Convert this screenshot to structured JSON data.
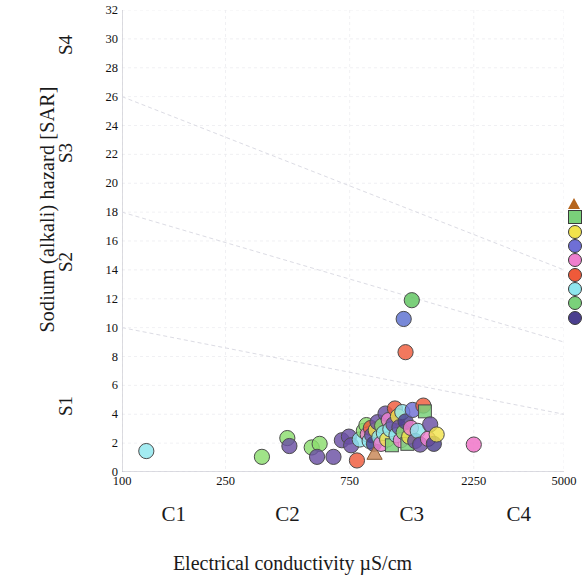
{
  "chart_data": {
    "type": "scatter",
    "title": "",
    "xlabel": "Electrical conductivity µS/cm",
    "ylabel": "Sodium (alkali) hazard [SAR]",
    "x_scale": "log",
    "xlim": [
      100,
      5000
    ],
    "ylim": [
      0,
      32
    ],
    "x_ticks": [
      "100",
      "250",
      "750",
      "2250",
      "5000"
    ],
    "x_tick_values": [
      100,
      250,
      750,
      2250,
      5000
    ],
    "y_ticks": [
      "0",
      "2",
      "4",
      "6",
      "8",
      "10",
      "12",
      "14",
      "16",
      "18",
      "20",
      "22",
      "24",
      "26",
      "28",
      "30",
      "32"
    ],
    "y_tick_values": [
      0,
      2,
      4,
      6,
      8,
      10,
      12,
      14,
      16,
      18,
      20,
      22,
      24,
      26,
      28,
      30,
      32
    ],
    "grid": true,
    "legend_position": "right",
    "salinity_classes": [
      {
        "label": "C1",
        "center_value": 158
      },
      {
        "label": "C2",
        "center_value": 433
      },
      {
        "label": "C3",
        "center_value": 1299
      },
      {
        "label": "C4",
        "center_value": 3354
      }
    ],
    "sodium_classes": [
      {
        "label": "S1",
        "center_sar": 4.5
      },
      {
        "label": "S2",
        "center_sar": 14.5
      },
      {
        "label": "S3",
        "center_sar": 22.0
      },
      {
        "label": "S4",
        "center_sar": 29.5
      }
    ],
    "boundary_lines": [
      {
        "name": "S1/S2",
        "points": [
          [
            100,
            10
          ],
          [
            5000,
            4
          ]
        ]
      },
      {
        "name": "S2/S3",
        "points": [
          [
            100,
            18
          ],
          [
            5000,
            9
          ]
        ]
      },
      {
        "name": "S3/S4",
        "points": [
          [
            100,
            26
          ],
          [
            5000,
            14
          ]
        ]
      }
    ],
    "legend_entries": [
      {
        "marker": "triangle",
        "color": "#b5651d"
      },
      {
        "marker": "square",
        "color": "#7ad17a"
      },
      {
        "marker": "circle",
        "color": "#f2e34c"
      },
      {
        "marker": "circle",
        "color": "#6f6fd6"
      },
      {
        "marker": "circle",
        "color": "#ef7fce"
      },
      {
        "marker": "circle",
        "color": "#ef5a3a"
      },
      {
        "marker": "circle",
        "color": "#8fe6ee"
      },
      {
        "marker": "circle",
        "color": "#7ad17a"
      },
      {
        "marker": "circle",
        "color": "#4b3f8f"
      }
    ],
    "points": [
      {
        "x": 124,
        "y": 1.45,
        "color": "#8fe6ee",
        "marker": "circle"
      },
      {
        "x": 345,
        "y": 1.05,
        "color": "#8bdd6e",
        "marker": "circle"
      },
      {
        "x": 432,
        "y": 2.35,
        "color": "#8bdd6e",
        "marker": "circle"
      },
      {
        "x": 440,
        "y": 1.8,
        "color": "#6a4fa3",
        "marker": "circle"
      },
      {
        "x": 536,
        "y": 1.7,
        "color": "#8bdd6e",
        "marker": "circle"
      },
      {
        "x": 575,
        "y": 1.95,
        "color": "#8bdd6e",
        "marker": "circle"
      },
      {
        "x": 562,
        "y": 1.05,
        "color": "#6a4fa3",
        "marker": "circle"
      },
      {
        "x": 650,
        "y": 1.05,
        "color": "#6a4fa3",
        "marker": "circle"
      },
      {
        "x": 700,
        "y": 2.2,
        "color": "#6a4fa3",
        "marker": "circle"
      },
      {
        "x": 745,
        "y": 2.45,
        "color": "#6a4fa3",
        "marker": "circle"
      },
      {
        "x": 760,
        "y": 1.85,
        "color": "#6a4fa3",
        "marker": "circle"
      },
      {
        "x": 800,
        "y": 0.8,
        "color": "#ef5a3a",
        "marker": "circle"
      },
      {
        "x": 820,
        "y": 2.25,
        "color": "#8fe6ee",
        "marker": "circle"
      },
      {
        "x": 850,
        "y": 2.85,
        "color": "#8bdd6e",
        "marker": "circle"
      },
      {
        "x": 870,
        "y": 3.25,
        "color": "#8bdd6e",
        "marker": "circle"
      },
      {
        "x": 880,
        "y": 2.6,
        "color": "#ef7fce",
        "marker": "circle"
      },
      {
        "x": 895,
        "y": 2.15,
        "color": "#8fe6ee",
        "marker": "circle"
      },
      {
        "x": 905,
        "y": 3.05,
        "color": "#ef5a3a",
        "marker": "circle"
      },
      {
        "x": 915,
        "y": 2.55,
        "color": "#6a4fa3",
        "marker": "circle"
      },
      {
        "x": 930,
        "y": 1.95,
        "color": "#4b3f8f",
        "marker": "circle"
      },
      {
        "x": 935,
        "y": 1.3,
        "color": "#c98a5a",
        "marker": "triangle"
      },
      {
        "x": 945,
        "y": 2.9,
        "color": "#f2e34c",
        "marker": "circle"
      },
      {
        "x": 960,
        "y": 3.45,
        "color": "#6a4fa3",
        "marker": "circle"
      },
      {
        "x": 975,
        "y": 2.4,
        "color": "#8fe6ee",
        "marker": "circle"
      },
      {
        "x": 990,
        "y": 1.95,
        "color": "#ef7fce",
        "marker": "circle"
      },
      {
        "x": 1000,
        "y": 3.2,
        "color": "#8bdd6e",
        "marker": "circle"
      },
      {
        "x": 1015,
        "y": 2.7,
        "color": "#8fe6ee",
        "marker": "circle"
      },
      {
        "x": 1030,
        "y": 4.05,
        "color": "#6a4fa3",
        "marker": "circle"
      },
      {
        "x": 1045,
        "y": 2.25,
        "color": "#f2e34c",
        "marker": "circle"
      },
      {
        "x": 1060,
        "y": 3.6,
        "color": "#ef7fce",
        "marker": "circle"
      },
      {
        "x": 1075,
        "y": 2.95,
        "color": "#8fe6ee",
        "marker": "circle"
      },
      {
        "x": 1090,
        "y": 1.85,
        "color": "#7ad17a",
        "marker": "square"
      },
      {
        "x": 1105,
        "y": 3.3,
        "color": "#6a4fa3",
        "marker": "circle"
      },
      {
        "x": 1120,
        "y": 4.4,
        "color": "#ef5a3a",
        "marker": "circle"
      },
      {
        "x": 1135,
        "y": 2.55,
        "color": "#8fe6ee",
        "marker": "circle"
      },
      {
        "x": 1150,
        "y": 3.85,
        "color": "#f2e34c",
        "marker": "circle"
      },
      {
        "x": 1165,
        "y": 3.1,
        "color": "#6a4fa3",
        "marker": "circle"
      },
      {
        "x": 1180,
        "y": 2.2,
        "color": "#ef7fce",
        "marker": "circle"
      },
      {
        "x": 1195,
        "y": 4.15,
        "color": "#8fe6ee",
        "marker": "circle"
      },
      {
        "x": 1210,
        "y": 2.75,
        "color": "#8bdd6e",
        "marker": "circle"
      },
      {
        "x": 1230,
        "y": 3.5,
        "color": "#4b3f8f",
        "marker": "circle"
      },
      {
        "x": 1250,
        "y": 1.95,
        "color": "#7ad17a",
        "marker": "square"
      },
      {
        "x": 1270,
        "y": 2.45,
        "color": "#f2e34c",
        "marker": "circle"
      },
      {
        "x": 1290,
        "y": 3.05,
        "color": "#ef7fce",
        "marker": "circle"
      },
      {
        "x": 1310,
        "y": 4.3,
        "color": "#6f6fd6",
        "marker": "circle"
      },
      {
        "x": 1340,
        "y": 2.15,
        "color": "#6a4fa3",
        "marker": "circle"
      },
      {
        "x": 1370,
        "y": 2.85,
        "color": "#8fe6ee",
        "marker": "circle"
      },
      {
        "x": 1400,
        "y": 1.9,
        "color": "#6a4fa3",
        "marker": "circle"
      },
      {
        "x": 1440,
        "y": 4.6,
        "color": "#ef5a3a",
        "marker": "circle"
      },
      {
        "x": 1460,
        "y": 4.2,
        "color": "#7ad17a",
        "marker": "square"
      },
      {
        "x": 1500,
        "y": 2.3,
        "color": "#ef7fce",
        "marker": "circle"
      },
      {
        "x": 1530,
        "y": 3.3,
        "color": "#6a4fa3",
        "marker": "circle"
      },
      {
        "x": 1580,
        "y": 1.95,
        "color": "#4b3f8f",
        "marker": "circle"
      },
      {
        "x": 1620,
        "y": 2.6,
        "color": "#f2e34c",
        "marker": "circle"
      },
      {
        "x": 1300,
        "y": 11.9,
        "color": "#5ec45e",
        "marker": "circle"
      },
      {
        "x": 1210,
        "y": 10.6,
        "color": "#5a6fd0",
        "marker": "circle"
      },
      {
        "x": 1230,
        "y": 8.3,
        "color": "#ef5a3a",
        "marker": "circle"
      },
      {
        "x": 2250,
        "y": 1.9,
        "color": "#ef6fc6",
        "marker": "circle"
      }
    ]
  }
}
